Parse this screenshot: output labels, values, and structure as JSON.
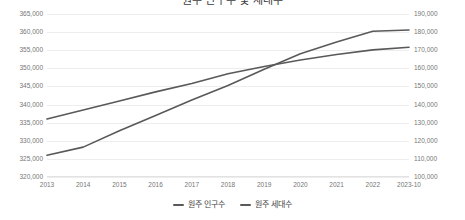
{
  "chart_data": {
    "type": "line",
    "title": "원주 인구수 및 세대수",
    "xlabel": "",
    "ylabel": "",
    "grid": true,
    "legend_position": "bottom",
    "categories": [
      "2013",
      "2014",
      "2015",
      "2016",
      "2017",
      "2018",
      "2019",
      "2020",
      "2021",
      "2022",
      "2023-10"
    ],
    "axes": {
      "left": {
        "name": "원주 인구수",
        "min": 320000,
        "max": 365000,
        "step": 5000,
        "ticks": [
          "320,000",
          "325,000",
          "330,000",
          "335,000",
          "340,000",
          "345,000",
          "350,000",
          "355,000",
          "360,000",
          "365,000"
        ],
        "tick_values": [
          320000,
          325000,
          330000,
          335000,
          340000,
          345000,
          350000,
          355000,
          360000,
          365000
        ]
      },
      "right": {
        "name": "원주 세대수",
        "min": 100000,
        "max": 190000,
        "step": 10000,
        "ticks": [
          "100,000",
          "110,000",
          "120,000",
          "130,000",
          "140,000",
          "150,000",
          "160,000",
          "170,000",
          "180,000",
          "190,000"
        ],
        "tick_values": [
          100000,
          110000,
          120000,
          130000,
          140000,
          150000,
          160000,
          170000,
          180000,
          190000
        ]
      }
    },
    "series": [
      {
        "name": "원주 인구수",
        "axis": "left",
        "color": "#595959",
        "values": [
          336000,
          338500,
          341000,
          343500,
          345800,
          348500,
          350500,
          352300,
          353800,
          355100,
          355800
        ]
      },
      {
        "name": "원주 세대수",
        "axis": "right",
        "color": "#595959",
        "values": [
          112000,
          116500,
          125500,
          134000,
          142500,
          150500,
          159500,
          168000,
          174500,
          180500,
          181200
        ]
      }
    ]
  },
  "legend": {
    "items": [
      {
        "label": "원주 인구수",
        "color": "#595959"
      },
      {
        "label": "원주 세대수",
        "color": "#595959"
      }
    ]
  }
}
